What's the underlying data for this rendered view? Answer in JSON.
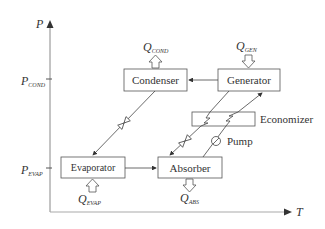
{
  "axes": {
    "y_label": "P",
    "x_label": "T",
    "y_ticks": [
      {
        "main": "P",
        "sub": "COND"
      },
      {
        "main": "P",
        "sub": "EVAP"
      }
    ]
  },
  "components": {
    "condenser": "Condenser",
    "generator": "Generator",
    "economizer": "Economizer",
    "evaporator": "Evaporator",
    "absorber": "Absorber",
    "pump": "Pump"
  },
  "heat_flows": {
    "cond": {
      "main": "Q",
      "sub": "COND"
    },
    "gen": {
      "main": "Q",
      "sub": "GEN"
    },
    "evap": {
      "main": "Q",
      "sub": "EVAP"
    },
    "abs": {
      "main": "Q",
      "sub": "ABS"
    }
  },
  "colors": {
    "line": "#444444",
    "axis": "#888888",
    "text": "#333333"
  }
}
